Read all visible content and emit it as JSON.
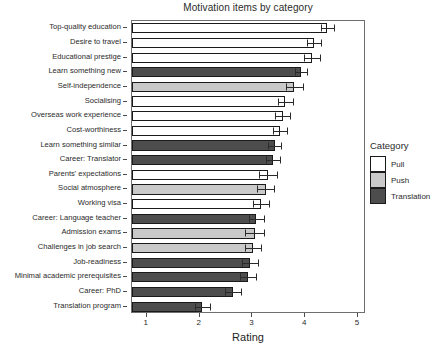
{
  "chart_data": {
    "type": "bar",
    "orientation": "horizontal",
    "title": "Motivation items by category",
    "xlabel": "Rating",
    "ylabel": "",
    "xlim": [
      0.72,
      5.15
    ],
    "xticks": [
      1,
      2,
      3,
      4,
      5
    ],
    "xticklabels": [
      "1",
      "2",
      "3",
      "4",
      "5"
    ],
    "grid": false,
    "legend": {
      "title": "Category",
      "position": "right",
      "entries": [
        {
          "label": "Pull",
          "color": "#ffffff"
        },
        {
          "label": "Push",
          "color": "#c9c9c9"
        },
        {
          "label": "Translation",
          "color": "#4d4d4d"
        }
      ]
    },
    "categories": [
      "Top-quality education",
      "Desire to travel",
      "Educational prestige",
      "Learn something new",
      "Self-independence",
      "Socialising",
      "Overseas work experience",
      "Cost-worthiness",
      "Learn something similar",
      "Career: Translator",
      "Parents' expectations",
      "Social atmosphere",
      "Working visa",
      "Career: Language teacher",
      "Admission exams",
      "Challenges in job search",
      "Job-readiness",
      "Minimal academic prerequisites",
      "Career: PhD",
      "Translation program"
    ],
    "values": [
      4.42,
      4.17,
      4.13,
      3.92,
      3.79,
      3.62,
      3.57,
      3.52,
      3.42,
      3.39,
      3.29,
      3.25,
      3.16,
      3.07,
      3.04,
      3.01,
      2.96,
      2.91,
      2.63,
      2.05
    ],
    "errors": [
      0.12,
      0.13,
      0.15,
      0.12,
      0.16,
      0.14,
      0.14,
      0.14,
      0.13,
      0.13,
      0.17,
      0.16,
      0.15,
      0.14,
      0.18,
      0.16,
      0.15,
      0.15,
      0.15,
      0.14
    ],
    "series_category": [
      "Pull",
      "Pull",
      "Pull",
      "Translation",
      "Push",
      "Pull",
      "Pull",
      "Pull",
      "Translation",
      "Translation",
      "Pull",
      "Push",
      "Pull",
      "Translation",
      "Push",
      "Push",
      "Translation",
      "Translation",
      "Translation",
      "Translation"
    ]
  }
}
